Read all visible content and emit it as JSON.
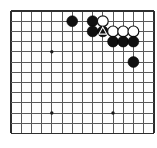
{
  "figure": {
    "type": "go-diagram",
    "width": 157,
    "height": 148,
    "background_color": "#ffffff"
  },
  "board": {
    "origin_x": 11,
    "origin_y": 11,
    "spacing": 10.2,
    "columns": 14,
    "rows": 12,
    "line_color": "#5a5a5a",
    "edge_color": "#2e2e2e",
    "corner_shown": "top-left",
    "star_points": [
      {
        "col": 4,
        "row": 4
      },
      {
        "col": 4,
        "row": 10
      },
      {
        "col": 10,
        "row": 10
      }
    ]
  },
  "stones": [
    {
      "id": "b1",
      "color": "black",
      "col": 6,
      "row": 1,
      "label": "black-stone"
    },
    {
      "id": "b2",
      "color": "black",
      "col": 8,
      "row": 1,
      "label": "black-stone"
    },
    {
      "id": "w1",
      "color": "white",
      "col": 9,
      "row": 1,
      "label": "white-stone"
    },
    {
      "id": "b3",
      "color": "black",
      "col": 8,
      "row": 2,
      "label": "black-stone"
    },
    {
      "id": "b4",
      "color": "black",
      "col": 9,
      "row": 2,
      "mark": "triangle",
      "label": "black-stone-marked"
    },
    {
      "id": "w2",
      "color": "white",
      "col": 10,
      "row": 2,
      "label": "white-stone"
    },
    {
      "id": "w3",
      "color": "white",
      "col": 11,
      "row": 2,
      "label": "white-stone"
    },
    {
      "id": "w4",
      "color": "white",
      "col": 12,
      "row": 2,
      "label": "white-stone"
    },
    {
      "id": "b5",
      "color": "black",
      "col": 10,
      "row": 3,
      "label": "black-stone"
    },
    {
      "id": "b6",
      "color": "black",
      "col": 11,
      "row": 3,
      "label": "black-stone"
    },
    {
      "id": "b7",
      "color": "black",
      "col": 12,
      "row": 3,
      "label": "black-stone"
    },
    {
      "id": "b8",
      "color": "black",
      "col": 12,
      "row": 5,
      "label": "black-stone"
    }
  ],
  "marks": {
    "triangle": {
      "name": "triangle-mark",
      "on_stone": "b4",
      "stroke_color": "#ffffff"
    }
  },
  "counts": {
    "black_stones": 8,
    "white_stones": 4,
    "marked_stones": 1
  }
}
